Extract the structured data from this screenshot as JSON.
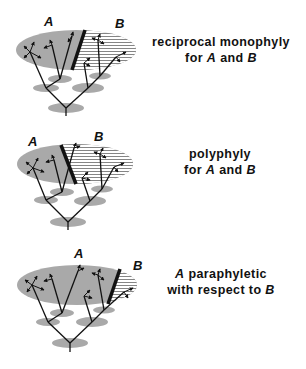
{
  "colors": {
    "background": "#ffffff",
    "ellipse_fill": "#a9a9a9",
    "hatch_fill": "#ffffff",
    "line": "#111111"
  },
  "panels": [
    {
      "id": "reciprocal-monophyly",
      "label_a": "A",
      "label_b": "B",
      "caption_line1": "reciprocal monophyly",
      "caption_line2_prefix": "for",
      "caption_line2_a": "A",
      "caption_line2_mid": "and",
      "caption_line2_b": "B"
    },
    {
      "id": "polyphyly",
      "label_a": "A",
      "label_b": "B",
      "caption_line1": "polyphyly",
      "caption_line2_prefix": "for",
      "caption_line2_a": "A",
      "caption_line2_mid": "and",
      "caption_line2_b": "B"
    },
    {
      "id": "paraphyly",
      "label_a": "A",
      "label_b": "B",
      "caption_line1_a": "A",
      "caption_line1_rest": "paraphyletic",
      "caption_line2_prefix": "with respect to",
      "caption_line2_b": "B"
    }
  ]
}
